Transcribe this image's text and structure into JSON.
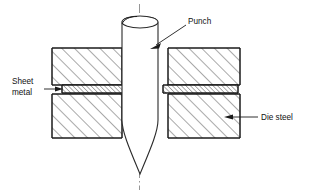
{
  "figure": {
    "type": "engineering-cross-section",
    "background_color": "#ffffff",
    "line_color": "#1a1a1a",
    "centerline_color": "#8a8a8a"
  },
  "labels": {
    "punch": "Punch",
    "sheet_metal_line1": "Sheet",
    "sheet_metal_line2": "metal",
    "die_steel": "Die steel"
  },
  "components": [
    {
      "name": "punch",
      "label": "Punch",
      "description": "Tapered cylindrical punch with ogive point, shown vertically through the die",
      "hatched": false
    },
    {
      "name": "upper-die-block-left",
      "label": "Die steel",
      "description": "Upper left die block with 45 degree section hatching",
      "hatched": true
    },
    {
      "name": "upper-die-block-right",
      "label": "Die steel",
      "description": "Upper right die block with 45 degree section hatching",
      "hatched": true
    },
    {
      "name": "lower-die-block-left",
      "label": "Die steel",
      "description": "Lower left die block with 45 degree section hatching",
      "hatched": true
    },
    {
      "name": "lower-die-block-right",
      "label": "Die steel",
      "description": "Lower right die block with 45 degree section hatching",
      "hatched": true
    },
    {
      "name": "sheet-metal-left",
      "label": "Sheet metal",
      "description": "Thin sheet metal strip clamped between upper and lower die on the left",
      "hatched": true
    },
    {
      "name": "sheet-metal-right",
      "label": "Sheet metal",
      "description": "Thin sheet metal strip clamped between upper and lower die on the right",
      "hatched": true
    },
    {
      "name": "centerline",
      "label": "",
      "description": "Vertical dash-dot axis centerline through the punch",
      "hatched": false
    }
  ],
  "annotations": [
    {
      "name": "punch-annotation",
      "text": "Punch",
      "text_x": 188,
      "text_y": 22,
      "arrow_from_x": 186,
      "arrow_from_y": 26,
      "arrow_to_x": 152,
      "arrow_to_y": 48,
      "arrow_direction": "down-left"
    },
    {
      "name": "sheet-metal-annotation",
      "text": "Sheet metal",
      "text_x": 12,
      "text_y": 84,
      "arrow_from_x": 46,
      "arrow_from_y": 89,
      "arrow_to_x": 62,
      "arrow_to_y": 89,
      "arrow_direction": "right"
    },
    {
      "name": "die-steel-annotation",
      "text": "Die steel",
      "text_x": 262,
      "text_y": 120,
      "arrow_from_x": 258,
      "arrow_from_y": 117,
      "arrow_to_x": 226,
      "arrow_to_y": 117,
      "arrow_direction": "left"
    }
  ]
}
